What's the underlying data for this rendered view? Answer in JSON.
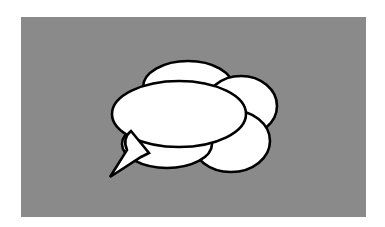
{
  "illustration": {
    "subject": "speech-bubble-cloud",
    "background_color": "#8a8a8a",
    "bubble_fill": "#ffffff",
    "bubble_outline": "#000000",
    "bubble_count": 5,
    "has_tail": true,
    "text": ""
  }
}
